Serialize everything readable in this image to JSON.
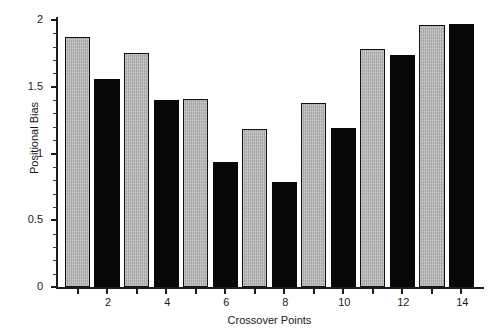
{
  "header": {
    "running_text": ""
  },
  "chart_data": {
    "type": "bar",
    "title": "",
    "subtitle": "",
    "xlabel": "Crossover Points",
    "ylabel": "Positional Bias",
    "xlim": [
      0.3,
      14.7
    ],
    "ylim": [
      0,
      2
    ],
    "grid": false,
    "legend": null,
    "x_tick_labels": [
      "2",
      "4",
      "6",
      "8",
      "10",
      "12",
      "14"
    ],
    "x_tick_values": [
      2,
      4,
      6,
      8,
      10,
      12,
      14
    ],
    "y_tick_labels": [
      "0",
      "0.5",
      "1",
      "1.5",
      "2"
    ],
    "y_tick_values": [
      0,
      0.5,
      1,
      1.5,
      2
    ],
    "y_minor_tick_step": 0.1,
    "categories": [
      1,
      2,
      3,
      4,
      5,
      6,
      7,
      8,
      9,
      10,
      11,
      12,
      13,
      14
    ],
    "values": [
      1.87,
      1.56,
      1.75,
      1.4,
      1.41,
      0.94,
      1.18,
      0.79,
      1.38,
      1.19,
      1.78,
      1.74,
      1.96,
      1.97
    ],
    "bar_styles": [
      "light",
      "dark",
      "light",
      "dark",
      "light",
      "dark",
      "light",
      "dark",
      "light",
      "dark",
      "light",
      "dark",
      "light",
      "dark"
    ],
    "colors": {
      "light_fill": "#b5b5b5",
      "light_edge": "#111111",
      "dark_fill": "#080808",
      "axis": "#1c1c1c",
      "text": "#1a1a1a",
      "background": "#ffffff"
    }
  }
}
